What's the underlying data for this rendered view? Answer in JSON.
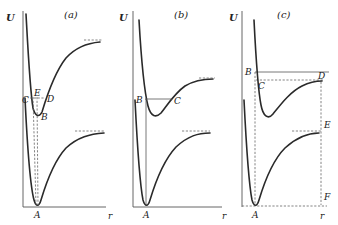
{
  "figure": {
    "panels": [
      {
        "title": "(a)",
        "y_axis_label": "U",
        "x_axis_label": "r",
        "points": {
          "A": "A",
          "B": "B",
          "C": "C",
          "D": "D",
          "E": "E"
        }
      },
      {
        "title": "(b)",
        "y_axis_label": "U",
        "x_axis_label": "r",
        "points": {
          "A": "A",
          "B": "B",
          "C": "C"
        }
      },
      {
        "title": "(c)",
        "y_axis_label": "U",
        "x_axis_label": "r",
        "points": {
          "A": "A",
          "B": "B",
          "C": "C",
          "D": "D",
          "E": "E",
          "F": "F"
        }
      }
    ],
    "colors": {
      "curve": "#2a2a2a",
      "axis": "#555555",
      "dashed": "#666666",
      "background": "#ffffff"
    }
  }
}
